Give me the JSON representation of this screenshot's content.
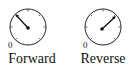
{
  "gauges": [
    {
      "name": "forward",
      "label": "Forward",
      "zero_label": "0",
      "needle_angle_deg": -45
    },
    {
      "name": "reverse",
      "label": "Reverse",
      "zero_label": "0",
      "needle_angle_deg": 50
    }
  ],
  "colors": {
    "stroke": "#111111",
    "background": "#ffffff"
  }
}
